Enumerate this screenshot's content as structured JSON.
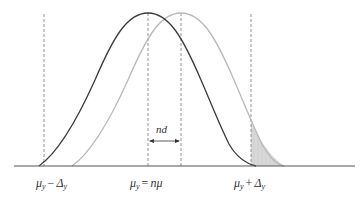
{
  "diagram": {
    "type": "two shifted normal distributions",
    "colors": {
      "curve_original": "#3a3a3a",
      "curve_shifted": "#b8b8b8",
      "baseline": "#555555",
      "dashed": "#777777",
      "shade": "#d6d6d6"
    },
    "curves": [
      {
        "name": "original",
        "center_label": "μy = nμ"
      },
      {
        "name": "shifted",
        "shift_label": "nd"
      }
    ],
    "shift_annotation": {
      "text": "nd"
    },
    "labels": {
      "left": {
        "mu": "μ",
        "mu_sub": "y",
        "op": "−",
        "delta": "Δ",
        "delta_sub": "y"
      },
      "center": {
        "mu": "μ",
        "mu_sub": "y",
        "op": "=",
        "rhs": "nμ"
      },
      "right": {
        "mu": "μ",
        "mu_sub": "y",
        "op": "+",
        "delta": "Δ",
        "delta_sub": "y"
      }
    },
    "shaded_region": "shifted curve tail beyond μy + Δy"
  }
}
